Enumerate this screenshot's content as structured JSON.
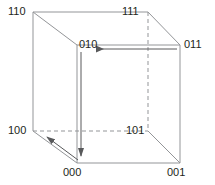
{
  "diagram": {
    "type": "cube-graph",
    "style": {
      "background": "#ffffff",
      "edge_solid_color": "#939598",
      "edge_dashed_color": "#939598",
      "arrow_color": "#58595b",
      "label_color": "#231f20",
      "edge_width": "1",
      "dash_pattern": "4 3"
    },
    "vertices": [
      {
        "id": "v110",
        "label": "110",
        "x": 33,
        "y": 12,
        "label_x": 8,
        "label_y": 6,
        "hidden": false
      },
      {
        "id": "v111",
        "label": "111",
        "x": 148,
        "y": 12,
        "label_x": 122,
        "label_y": 6,
        "hidden": false
      },
      {
        "id": "v010",
        "label": "010",
        "x": 77,
        "y": 45,
        "label_x": 79,
        "label_y": 39,
        "hidden": false
      },
      {
        "id": "v011",
        "label": "011",
        "x": 180,
        "y": 45,
        "label_x": 184,
        "label_y": 39,
        "hidden": false
      },
      {
        "id": "v100",
        "label": "100",
        "x": 33,
        "y": 131,
        "label_x": 8,
        "label_y": 125,
        "hidden": false
      },
      {
        "id": "v101",
        "label": "101",
        "x": 148,
        "y": 131,
        "label_x": 126,
        "label_y": 125,
        "hidden": true
      },
      {
        "id": "v000",
        "label": "000",
        "x": 77,
        "y": 163,
        "label_x": 63,
        "label_y": 167,
        "hidden": false
      },
      {
        "id": "v001",
        "label": "001",
        "x": 180,
        "y": 163,
        "label_x": 167,
        "label_y": 167,
        "hidden": false
      }
    ],
    "edges_solid": [
      {
        "from": "v110",
        "to": "v111",
        "x1": 33,
        "y1": 12,
        "x2": 148,
        "y2": 12
      },
      {
        "from": "v110",
        "to": "v100",
        "x1": 33,
        "y1": 12,
        "x2": 33,
        "y2": 131
      },
      {
        "from": "v110",
        "to": "v010",
        "x1": 33,
        "y1": 12,
        "x2": 77,
        "y2": 45
      },
      {
        "from": "v111",
        "to": "v011",
        "x1": 148,
        "y1": 12,
        "x2": 180,
        "y2": 45
      },
      {
        "from": "v010",
        "to": "v011",
        "x1": 77,
        "y1": 45,
        "x2": 180,
        "y2": 45
      },
      {
        "from": "v010",
        "to": "v000",
        "x1": 77,
        "y1": 45,
        "x2": 77,
        "y2": 163
      },
      {
        "from": "v011",
        "to": "v001",
        "x1": 180,
        "y1": 45,
        "x2": 180,
        "y2": 163
      },
      {
        "from": "v000",
        "to": "v001",
        "x1": 77,
        "y1": 163,
        "x2": 180,
        "y2": 163
      },
      {
        "from": "v100",
        "to": "v000",
        "x1": 33,
        "y1": 131,
        "x2": 77,
        "y2": 163
      },
      {
        "from": "v101",
        "to": "v001",
        "x1": 148,
        "y1": 131,
        "x2": 180,
        "y2": 163
      }
    ],
    "edges_dashed": [
      {
        "from": "v111",
        "to": "v101",
        "x1": 148,
        "y1": 12,
        "x2": 148,
        "y2": 131
      },
      {
        "from": "v100",
        "to": "v101",
        "x1": 33,
        "y1": 131,
        "x2": 148,
        "y2": 131
      }
    ],
    "arrows": [
      {
        "id": "arrow-011-to-010",
        "from": "v011",
        "to": "v010",
        "direction": "left",
        "x1": 177,
        "y1": 49,
        "x2": 94,
        "y2": 49
      },
      {
        "id": "arrow-010-to-000",
        "from": "v010",
        "to": "v000",
        "direction": "down",
        "x1": 81,
        "y1": 52,
        "x2": 81,
        "y2": 159
      },
      {
        "id": "arrow-000-to-100",
        "from": "v000",
        "to": "v100",
        "direction": "up-left",
        "x1": 78,
        "y1": 160,
        "x2": 44,
        "y2": 135
      }
    ],
    "path_sequence": [
      "011",
      "010",
      "000",
      "100"
    ]
  }
}
